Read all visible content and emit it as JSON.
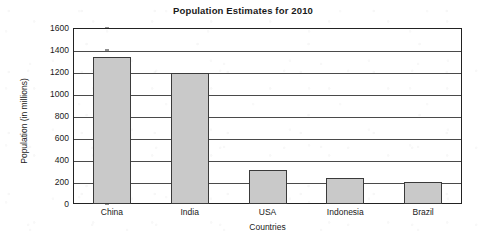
{
  "chart_data": {
    "type": "bar",
    "title": "Population Estimates for 2010",
    "xlabel": "Countries",
    "ylabel": "Population (in millions)",
    "categories": [
      "China",
      "India",
      "USA",
      "Indonesia",
      "Brazil"
    ],
    "values": [
      1340,
      1190,
      310,
      240,
      200
    ],
    "ylim": [
      0,
      1600
    ],
    "ytick_step": 200,
    "yticks": [
      0,
      200,
      400,
      600,
      800,
      1000,
      1200,
      1400,
      1600
    ],
    "grid": "horizontal",
    "legend": "none",
    "bar_fill_color": "#c9c9c9",
    "bar_border_color": "#3a3a3a",
    "axis_color": "#222222",
    "background_color": "#ffffff"
  }
}
